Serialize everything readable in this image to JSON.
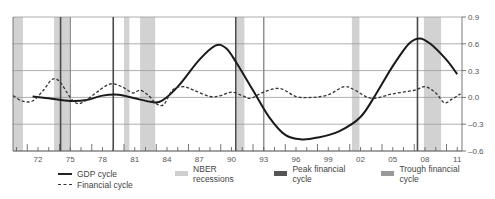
{
  "chart_data": {
    "type": "line",
    "title": "",
    "xlabel": "",
    "ylabel": "",
    "ylim": [
      -0.6,
      0.9
    ],
    "xlim": [
      1969.7,
      2011.5
    ],
    "y_ticks": [
      0.9,
      0.6,
      0.3,
      0.0,
      -0.3,
      -0.6
    ],
    "y_tick_labels": [
      "0.9",
      "0.6",
      "0.3",
      "0.0",
      "–0.3",
      "–0.6"
    ],
    "x_ticks": [
      1972,
      1975,
      1978,
      1981,
      1984,
      1987,
      1990,
      1993,
      1996,
      1999,
      2002,
      2005,
      2008,
      2011
    ],
    "x_tick_labels": [
      "72",
      "75",
      "78",
      "81",
      "84",
      "87",
      "90",
      "93",
      "96",
      "99",
      "02",
      "05",
      "08",
      "11"
    ],
    "grid": "horizontal",
    "y_axis_position": "right",
    "legend_position": "bottom",
    "series": [
      {
        "name": "GDP cycle",
        "style": "solid",
        "color": "#1a1a1a",
        "points": [
          [
            1971.5,
            0.01
          ],
          [
            1973,
            -0.01
          ],
          [
            1975,
            -0.04
          ],
          [
            1976.5,
            -0.03
          ],
          [
            1978,
            0.02
          ],
          [
            1979.5,
            0.03
          ],
          [
            1981,
            -0.01
          ],
          [
            1982.5,
            -0.05
          ],
          [
            1983.5,
            -0.04
          ],
          [
            1985,
            0.12
          ],
          [
            1987,
            0.42
          ],
          [
            1988.5,
            0.58
          ],
          [
            1989.5,
            0.55
          ],
          [
            1990.5,
            0.38
          ],
          [
            1992,
            0.08
          ],
          [
            1993.5,
            -0.22
          ],
          [
            1995,
            -0.42
          ],
          [
            1996.5,
            -0.47
          ],
          [
            1998,
            -0.45
          ],
          [
            2000,
            -0.38
          ],
          [
            2002,
            -0.22
          ],
          [
            2003.5,
            0.05
          ],
          [
            2005,
            0.35
          ],
          [
            2006.5,
            0.6
          ],
          [
            2007.5,
            0.66
          ],
          [
            2008.5,
            0.6
          ],
          [
            2010,
            0.42
          ],
          [
            2011,
            0.26
          ]
        ]
      },
      {
        "name": "Financial cycle",
        "style": "dashed",
        "color": "#333333",
        "points": [
          [
            1969.7,
            0.02
          ],
          [
            1970.5,
            -0.04
          ],
          [
            1971.5,
            -0.04
          ],
          [
            1972.5,
            0.08
          ],
          [
            1973.3,
            0.2
          ],
          [
            1974,
            0.18
          ],
          [
            1975,
            0.0
          ],
          [
            1975.7,
            -0.07
          ],
          [
            1976.5,
            -0.03
          ],
          [
            1977.5,
            0.06
          ],
          [
            1978.7,
            0.15
          ],
          [
            1979.8,
            0.12
          ],
          [
            1980.8,
            0.05
          ],
          [
            1981.5,
            0.08
          ],
          [
            1982.3,
            0.02
          ],
          [
            1983,
            -0.07
          ],
          [
            1983.7,
            -0.08
          ],
          [
            1984.5,
            0.08
          ],
          [
            1985.5,
            0.12
          ],
          [
            1986.5,
            0.08
          ],
          [
            1988,
            0.01
          ],
          [
            1989,
            0.02
          ],
          [
            1990,
            0.06
          ],
          [
            1991,
            0.02
          ],
          [
            1991.8,
            -0.01
          ],
          [
            1993,
            0.06
          ],
          [
            1994.5,
            0.1
          ],
          [
            1996,
            0.01
          ],
          [
            1997.5,
            0.0
          ],
          [
            1999,
            0.03
          ],
          [
            2000.5,
            0.12
          ],
          [
            2001.5,
            0.08
          ],
          [
            2003,
            -0.01
          ],
          [
            2005,
            0.04
          ],
          [
            2007,
            0.08
          ],
          [
            2008,
            0.12
          ],
          [
            2009,
            0.05
          ],
          [
            2009.8,
            -0.06
          ],
          [
            2010.5,
            -0.02
          ],
          [
            2011.3,
            0.04
          ]
        ]
      }
    ],
    "nber_recessions": [
      [
        1969.7,
        1970.6
      ],
      [
        1973.5,
        1974.9
      ],
      [
        1980.0,
        1980.5
      ],
      [
        1981.5,
        1982.9
      ],
      [
        1990.5,
        1991.2
      ],
      [
        2001.2,
        2001.9
      ],
      [
        2007.9,
        2009.5
      ]
    ],
    "peak_financial_cycle": [
      1974.1,
      1979.0,
      1990.4,
      2007.3
    ],
    "trough_financial_cycle": [
      1975.0,
      1993.0
    ],
    "legend": [
      {
        "label": "GDP cycle",
        "swatch": "solid-line"
      },
      {
        "label": "Financial cycle",
        "swatch": "dashed-line"
      },
      {
        "label": "NBER recessions",
        "swatch": "box",
        "color": "#cfcfcf"
      },
      {
        "label": "Peak financial cycle",
        "swatch": "box",
        "color": "#555555"
      },
      {
        "label": "Trough financial cycle",
        "swatch": "box",
        "color": "#999999"
      }
    ]
  },
  "colors": {
    "recession": "#d2d2d2",
    "peak_line": "#4a4a4a",
    "trough_line": "#8a8a8a",
    "grid": "#9a9a9a",
    "axis": "#555555"
  }
}
